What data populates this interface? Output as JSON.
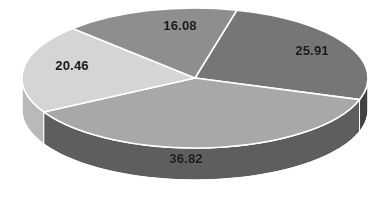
{
  "chart_data": {
    "type": "pie",
    "title": "",
    "subtitle": "",
    "xlabel": "",
    "ylabel": "",
    "grid": false,
    "legend": "none",
    "three_d": true,
    "labels_shown_on_slices": true,
    "label_format": "value",
    "background_color": "#ffffff",
    "separator_color": "#ffffff",
    "label_text_color": "#18181a",
    "side_wall_color": "#4a4a4a",
    "side_wall_light_color": "#b9b9b9",
    "total": 99.27,
    "categories": [
      "25.91",
      "36.82",
      "20.46",
      "16.08"
    ],
    "values": [
      25.91,
      36.82,
      20.46,
      16.08
    ],
    "slices": [
      {
        "name": "slice-25-91",
        "label": "25.91",
        "value": 25.91,
        "color": "#767676",
        "start_angle": -76,
        "end_angle": 18,
        "label_x": 312,
        "label_y": 50
      },
      {
        "name": "slice-36-82",
        "label": "36.82",
        "value": 36.82,
        "color": "#a8a8a8",
        "start_angle": 18,
        "end_angle": 151,
        "label_x": 186,
        "label_y": 158
      },
      {
        "name": "slice-20-46",
        "label": "20.46",
        "value": 20.46,
        "color": "#d5d5d5",
        "start_angle": 151,
        "end_angle": 225,
        "label_x": 72,
        "label_y": 65
      },
      {
        "name": "slice-16-08",
        "label": "16.08",
        "value": 16.08,
        "color": "#8e8e8e",
        "start_angle": 225,
        "end_angle": 284,
        "label_x": 180,
        "label_y": 25
      }
    ],
    "geometry": {
      "center_x": 195,
      "center_y": 78,
      "radius_x": 173,
      "radius_y": 70,
      "depth": 32
    }
  }
}
